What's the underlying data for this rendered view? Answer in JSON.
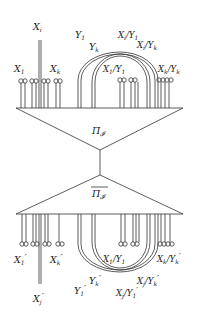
{
  "diagram": {
    "type": "tensor-network",
    "top_block": {
      "label": "Π_𝓘",
      "label_text": "Π",
      "label_sub": "𝓘"
    },
    "bottom_block": {
      "label": "overline(Π_𝓘)",
      "label_text": "Π",
      "label_sub": "𝓘"
    },
    "top_labels": {
      "xi": "X",
      "xi_sub": "i",
      "x1": "X",
      "x1_sub": "1",
      "xk": "X",
      "xk_sub": "k",
      "y1": "Y",
      "y1_sub": "1",
      "yk": "Y",
      "yk_sub": "k",
      "xi_y1": "X",
      "xi_y1_sub": "i",
      "xi_y1_rest": "/Y",
      "xi_y1_rest_sub": "1",
      "xi_yk": "X",
      "xi_yk_sub": "i",
      "xi_yk_rest": "/Y",
      "xi_yk_rest_sub": "k",
      "x1_y1": "X",
      "x1_y1_sub": "1",
      "x1_y1_rest": "/Y",
      "x1_y1_rest_sub": "1",
      "xk_yk": "X",
      "xk_yk_sub": "k",
      "xk_yk_rest": "/Y",
      "xk_yk_rest_sub": "k"
    },
    "bottom_labels": {
      "xj": "X",
      "xj_sub": "j",
      "prime": "′",
      "x1": "X",
      "x1_sub": "1",
      "xk": "X",
      "xk_sub": "k",
      "y1": "Y",
      "y1_sub": "1",
      "yk": "Y",
      "yk_sub": "k",
      "x1_y1": "X",
      "x1_y1_sub": "1",
      "x1_y1_rest": "/Y",
      "x1_y1_rest_sub": "1",
      "xk_yk": "X",
      "xk_yk_sub": "k",
      "xk_yk_rest": "/Y",
      "xk_yk_rest_sub": "k",
      "xj_yk": "X",
      "xj_yk_sub": "j",
      "xj_yk_rest": "/Y",
      "xj_yk_rest_sub": "k",
      "xj_y1": "X",
      "xj_y1_sub": "j",
      "xj_y1_rest": "/Y",
      "xj_y1_rest_sub": "1"
    }
  }
}
